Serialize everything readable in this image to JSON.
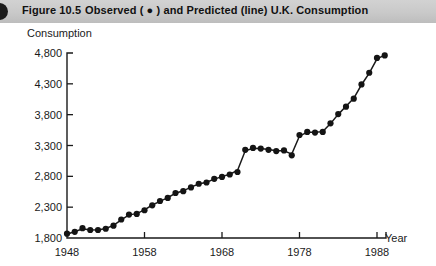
{
  "header": {
    "bullet_icon": "filled-circle-icon",
    "figure_number": "Figure 10.5",
    "caption": "Observed ( ● ) and Predicted (line) U.K. Consumption",
    "background_color": "#c9c9c9",
    "text_color": "#111111"
  },
  "chart_data": {
    "type": "scatter",
    "title": "Observed ( ● ) and Predicted (line) U.K. Consumption",
    "xlabel": "Year",
    "ylabel": "Consumption",
    "xlim": [
      1948,
      1990
    ],
    "ylim": [
      1800,
      4800
    ],
    "xticks": [
      1948,
      1958,
      1968,
      1978,
      1988
    ],
    "xtick_labels": [
      "1948",
      "1958",
      "1968",
      "1978",
      "1988"
    ],
    "yticks": [
      1800,
      2300,
      2800,
      3300,
      3800,
      4300,
      4800
    ],
    "ytick_labels": [
      "1,800",
      "2,300",
      "2,800",
      "3,300",
      "3,800",
      "4,300",
      "4,800"
    ],
    "grid": false,
    "legend_position": "title",
    "legend": [
      {
        "name": "Observed",
        "marker": "filled-circle",
        "color": "#141414"
      },
      {
        "name": "Predicted",
        "marker": "line",
        "color": "#1a1a1a"
      }
    ],
    "marker_color": "#141414",
    "line_color": "#1a1a1a",
    "x": [
      1948,
      1949,
      1950,
      1951,
      1952,
      1953,
      1954,
      1955,
      1956,
      1957,
      1958,
      1959,
      1960,
      1961,
      1962,
      1963,
      1964,
      1965,
      1966,
      1967,
      1968,
      1969,
      1970,
      1971,
      1972,
      1973,
      1974,
      1975,
      1976,
      1977,
      1978,
      1979,
      1980,
      1981,
      1982,
      1983,
      1984,
      1985,
      1986,
      1987,
      1988,
      1989
    ],
    "series": [
      {
        "name": "Observed",
        "marker": "filled-circle",
        "values": [
          1870,
          1900,
          1960,
          1930,
          1930,
          1950,
          2000,
          2100,
          2180,
          2190,
          2250,
          2330,
          2400,
          2450,
          2530,
          2560,
          2620,
          2680,
          2700,
          2760,
          2790,
          2830,
          2870,
          3230,
          3260,
          3250,
          3230,
          3210,
          3220,
          3140,
          3470,
          3520,
          3510,
          3520,
          3660,
          3810,
          3930,
          4060,
          4290,
          4480,
          4720,
          4760
        ]
      },
      {
        "name": "Predicted",
        "marker": "line",
        "values": [
          1860,
          1905,
          1945,
          1935,
          1930,
          1955,
          2005,
          2095,
          2175,
          2195,
          2255,
          2335,
          2395,
          2455,
          2525,
          2565,
          2625,
          2675,
          2705,
          2755,
          2795,
          2835,
          2895,
          3215,
          3255,
          3250,
          3235,
          3215,
          3215,
          3160,
          3455,
          3515,
          3515,
          3525,
          3655,
          3805,
          3935,
          4065,
          4285,
          4475,
          4705,
          4765
        ]
      }
    ]
  }
}
